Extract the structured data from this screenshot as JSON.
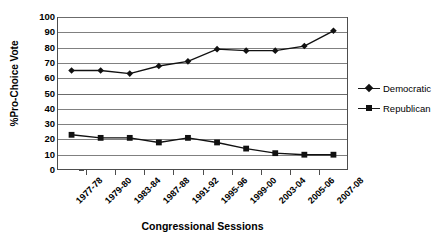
{
  "chart_data": {
    "type": "line",
    "title": "",
    "xlabel": "Congressional Sessions",
    "ylabel": "%Pro-Choice Vote",
    "ylim": [
      0,
      100
    ],
    "ytick_step": 10,
    "grid": true,
    "legend_position": "right",
    "categories": [
      "1977-78",
      "1979-80",
      "1983-84",
      "1987-88",
      "1991-92",
      "1995-96",
      "1999-00",
      "2003-04",
      "2005-06",
      "2007-08"
    ],
    "yticks": [
      "0",
      "10",
      "20",
      "30",
      "40",
      "50",
      "60",
      "70",
      "80",
      "90",
      "100"
    ],
    "series": [
      {
        "name": "Democratic",
        "marker": "diamond",
        "color": "#111111",
        "values": [
          65,
          65,
          63,
          68,
          71,
          79,
          78,
          78,
          81,
          91
        ]
      },
      {
        "name": "Republican",
        "marker": "square",
        "color": "#111111",
        "values": [
          23,
          21,
          21,
          18,
          21,
          18,
          14,
          11,
          10,
          10
        ]
      }
    ]
  },
  "legend": {
    "items": [
      {
        "label": "Democratic"
      },
      {
        "label": "Republican"
      }
    ]
  }
}
